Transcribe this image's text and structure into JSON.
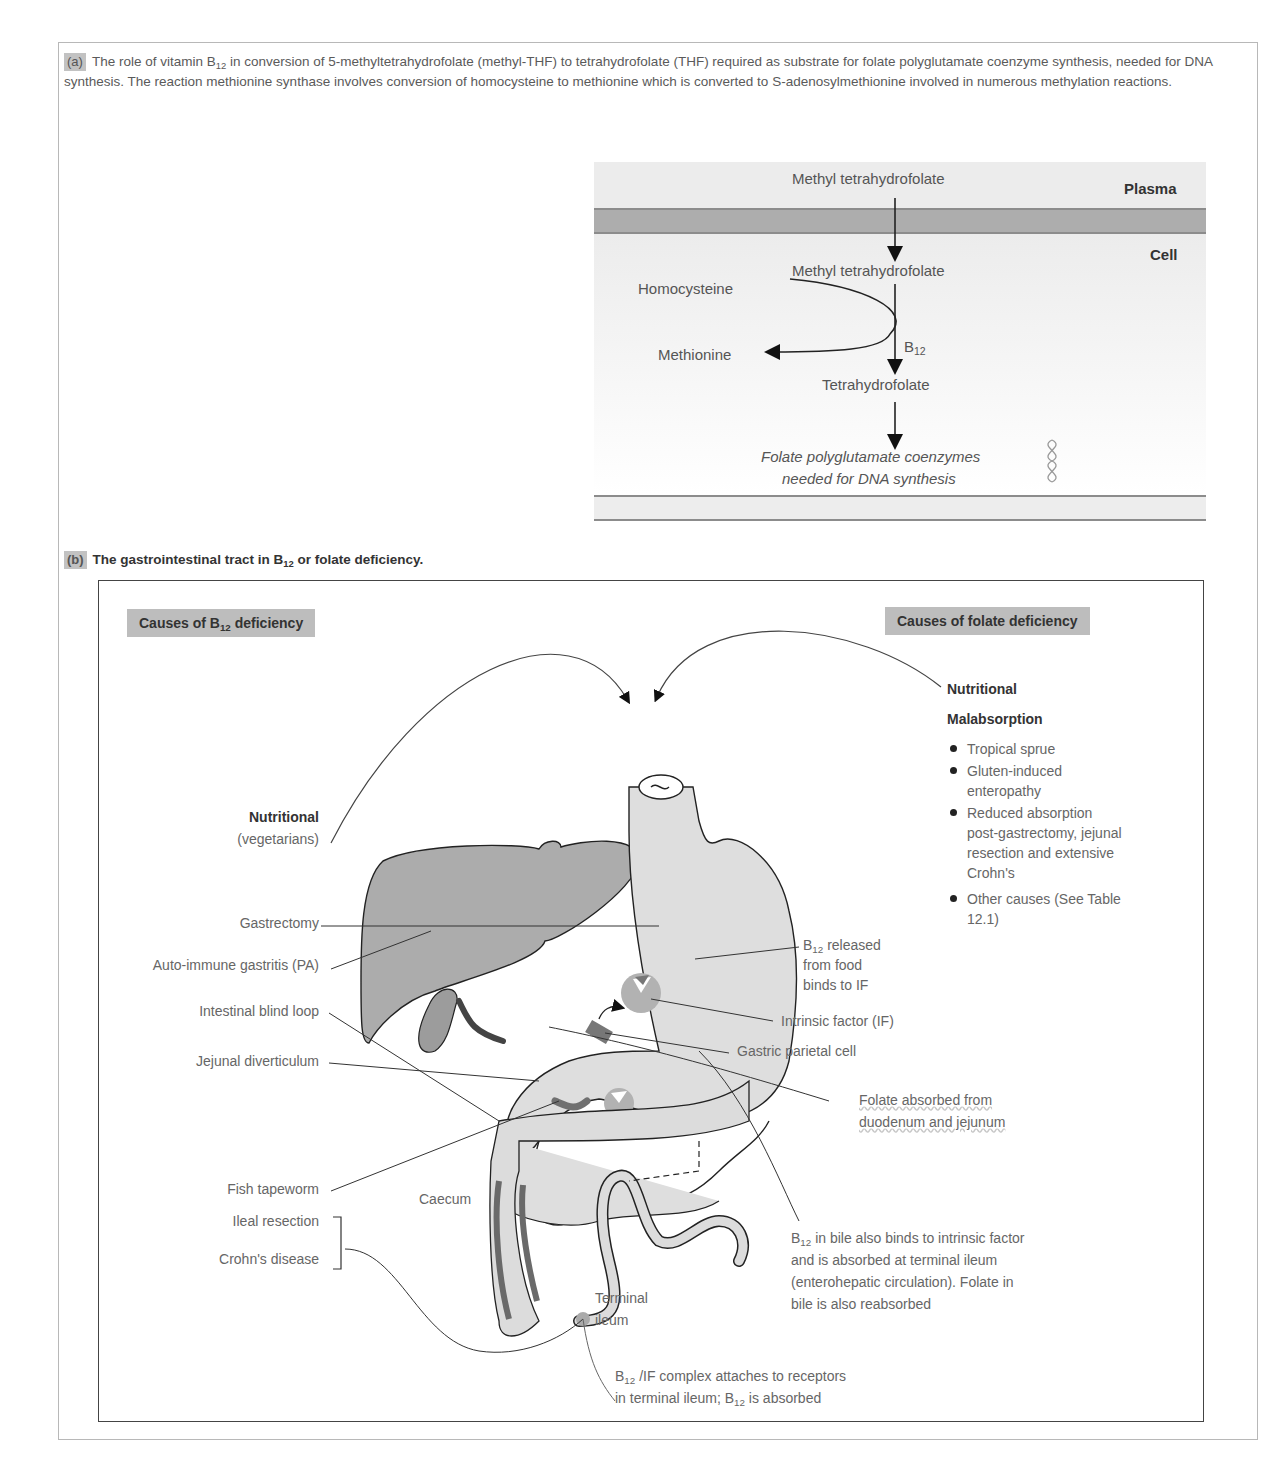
{
  "panel_a": {
    "tag": "(a)",
    "caption": "The role of vitamin B12 in conversion of 5-methyltetrahydrofolate (methyl-THF) to tetrahydrofolate (THF) required as substrate for folate polyglutamate coenzyme synthesis, needed for DNA synthesis. The reaction methionine synthase involves conversion of homocysteine to methionine which is converted to S-adenosylmethionine involved in numerous methylation reactions.",
    "caption_parts": {
      "pre": "The role of vitamin B",
      "sub": "12",
      "post": " in conversion of 5-methyltetrahydrofolate (methyl-THF) to tetrahydrofolate (THF) required as substrate for folate polyglutamate coenzyme synthesis, needed for DNA synthesis. The reaction methionine synthase involves conversion of homocysteine to methionine which is converted to S-adenosylmethionine involved in numerous methylation reactions."
    },
    "diagram": {
      "compartment_plasma": "Plasma",
      "compartment_cell": "Cell",
      "plasma_substrate": "Methyl tetrahydrofolate",
      "cell_substrate": "Methyl tetrahydrofolate",
      "homocysteine": "Homocysteine",
      "methionine": "Methionine",
      "cofactor": "B",
      "cofactor_sub": "12",
      "product": "Tetrahydrofolate",
      "end_product_line1": "Folate polyglutamate coenzymes",
      "end_product_line2": "needed for DNA synthesis",
      "dna_icon": "dna-helix-icon"
    }
  },
  "panel_b": {
    "tag": "(b)",
    "caption_pre": "The gastrointestinal tract in B",
    "caption_sub": "12",
    "caption_post": " or folate deficiency.",
    "b12_box": {
      "pre": "Causes of B",
      "sub": "12",
      "post": " deficiency"
    },
    "folate_box": "Causes of folate deficiency",
    "b12_causes": {
      "nutritional": "Nutritional",
      "nutritional_note": "(vegetarians)",
      "gastrectomy": "Gastrectomy",
      "autoimmune": "Auto-immune gastritis (PA)",
      "blind_loop": "Intestinal blind loop",
      "jejunal_diverticulum": "Jejunal diverticulum",
      "fish_tapeworm": "Fish tapeworm",
      "ileal_resection": "Ileal resection",
      "crohns": "Crohn's disease"
    },
    "folate_causes": {
      "nutritional": "Nutritional",
      "malabsorption": "Malabsorption",
      "bullets": [
        "Tropical sprue",
        "Gluten-induced enteropathy",
        "Reduced absorption post-gastrectomy, jejunal resection and extensive Crohn's",
        "Other causes (See Table 12.1)"
      ]
    },
    "anatomy_labels": {
      "b12_released": {
        "pre": "B",
        "sub": "12",
        "line1_post": " released",
        "line2": "from food",
        "line3": "binds to IF"
      },
      "intrinsic_factor": "Intrinsic factor (IF)",
      "parietal_cell": "Gastric parietal cell",
      "folate_absorbed_line1": "Folate absorbed from",
      "folate_absorbed_line2": "duodenum and jejunum",
      "caecum": "Caecum",
      "terminal_ileum_line1": "Terminal",
      "terminal_ileum_line2": "ileum",
      "bile_note": {
        "pre": "B",
        "sub": "12",
        "line1_post": " in bile also binds to intrinsic factor",
        "line2": "and is absorbed at terminal ileum",
        "line3": "(enterohepatic circulation). Folate in",
        "line4": "bile is also reabsorbed"
      },
      "receptor_note": {
        "pre": "B",
        "sub": "12",
        "line1_post": " /IF complex attaches to receptors",
        "line2_pre": "in terminal ileum; B",
        "line2_sub": "12",
        "line2_post": " is absorbed"
      }
    }
  },
  "colors": {
    "tag_bg": "#c2c2c2",
    "membrane": "#adadad",
    "liver": "#a9a9a9",
    "gut": "#dcdcdc",
    "gallbladder": "#9a9a9a",
    "if_protein": "#b0b0b0",
    "dark_accent": "#6e6e6e"
  }
}
